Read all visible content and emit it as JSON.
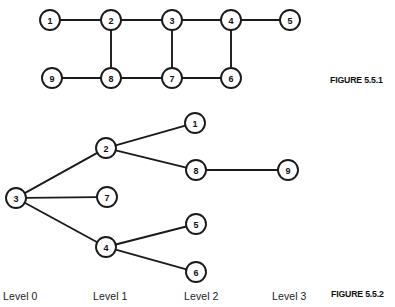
{
  "page": {
    "width": 395,
    "height": 307,
    "background": "#ffffff",
    "ink_color": "#1a1a1a"
  },
  "figure1": {
    "caption": "FIGURE 5.5.1",
    "type": "undirected-graph",
    "node_radius": 10,
    "nodes": [
      {
        "id": "1",
        "label": "1",
        "x": 50,
        "y": 20
      },
      {
        "id": "2",
        "label": "2",
        "x": 111,
        "y": 20
      },
      {
        "id": "3",
        "label": "3",
        "x": 172,
        "y": 20
      },
      {
        "id": "4",
        "label": "4",
        "x": 231,
        "y": 20
      },
      {
        "id": "5",
        "label": "5",
        "x": 290,
        "y": 20
      },
      {
        "id": "9",
        "label": "9",
        "x": 52,
        "y": 78
      },
      {
        "id": "8",
        "label": "8",
        "x": 111,
        "y": 78
      },
      {
        "id": "7",
        "label": "7",
        "x": 172,
        "y": 78
      },
      {
        "id": "6",
        "label": "6",
        "x": 231,
        "y": 78
      }
    ],
    "edges": [
      {
        "from": "1",
        "to": "2"
      },
      {
        "from": "2",
        "to": "3"
      },
      {
        "from": "3",
        "to": "4"
      },
      {
        "from": "4",
        "to": "5"
      },
      {
        "from": "2",
        "to": "8"
      },
      {
        "from": "3",
        "to": "7"
      },
      {
        "from": "4",
        "to": "6"
      },
      {
        "from": "9",
        "to": "8"
      },
      {
        "from": "8",
        "to": "7"
      },
      {
        "from": "7",
        "to": "6"
      }
    ]
  },
  "figure2": {
    "caption": "FIGURE 5.5.2",
    "type": "tree",
    "root": "3",
    "node_radius": 10,
    "nodes": [
      {
        "id": "3",
        "label": "3",
        "x": 16,
        "y": 198,
        "level": 0
      },
      {
        "id": "2",
        "label": "2",
        "x": 106,
        "y": 148,
        "level": 1
      },
      {
        "id": "7",
        "label": "7",
        "x": 107,
        "y": 197,
        "level": 1
      },
      {
        "id": "4",
        "label": "4",
        "x": 106,
        "y": 247,
        "level": 1
      },
      {
        "id": "1",
        "label": "1",
        "x": 195,
        "y": 123,
        "level": 2
      },
      {
        "id": "8",
        "label": "8",
        "x": 196,
        "y": 170,
        "level": 2
      },
      {
        "id": "5",
        "label": "5",
        "x": 196,
        "y": 224,
        "level": 2
      },
      {
        "id": "6",
        "label": "6",
        "x": 196,
        "y": 272,
        "level": 2
      },
      {
        "id": "9",
        "label": "9",
        "x": 288,
        "y": 170,
        "level": 3
      }
    ],
    "edges": [
      {
        "from": "3",
        "to": "2"
      },
      {
        "from": "3",
        "to": "7"
      },
      {
        "from": "3",
        "to": "4"
      },
      {
        "from": "2",
        "to": "1"
      },
      {
        "from": "2",
        "to": "8"
      },
      {
        "from": "8",
        "to": "9"
      },
      {
        "from": "4",
        "to": "5"
      },
      {
        "from": "4",
        "to": "6"
      }
    ],
    "level_labels": [
      {
        "text": "Level 0",
        "x": 3,
        "y": 290
      },
      {
        "text": "Level 1",
        "x": 93,
        "y": 290
      },
      {
        "text": "Level 2",
        "x": 184,
        "y": 290
      },
      {
        "text": "Level 3",
        "x": 272,
        "y": 290
      }
    ]
  }
}
